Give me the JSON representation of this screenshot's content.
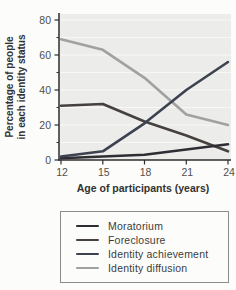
{
  "figure": {
    "y_axis_title_line1": "Percentage of people",
    "y_axis_title_line2": "in each identity status",
    "x_axis_title": "Age of participants (years)"
  },
  "chart_data": {
    "type": "line",
    "x": [
      12,
      15,
      18,
      21,
      24
    ],
    "xlabel": "Age of participants (years)",
    "ylabel": "Percentage of people in each identity status",
    "xlim": [
      12,
      24
    ],
    "ylim": [
      0,
      80
    ],
    "x_ticks": [
      12,
      15,
      18,
      21,
      24
    ],
    "y_ticks": [
      0,
      20,
      40,
      60,
      80
    ],
    "y_minor_ticks": [
      10,
      30,
      50,
      70
    ],
    "grid": "horizontal light gridlines on gray panel",
    "legend_position": "boxed below chart",
    "series": [
      {
        "name": "Moratorium",
        "color": "#2e2d33",
        "values": [
          1,
          2,
          3,
          6,
          9
        ]
      },
      {
        "name": "Foreclosure",
        "color": "#46403f",
        "values": [
          31,
          32,
          22,
          14,
          5
        ]
      },
      {
        "name": "Identity achievement",
        "color": "#3d4251",
        "values": [
          2,
          5,
          21,
          40,
          56
        ]
      },
      {
        "name": "Identity diffusion",
        "color": "#a1a19f",
        "values": [
          69,
          63,
          47,
          26,
          20
        ]
      }
    ],
    "legend": [
      "Moratorium",
      "Foreclosure",
      "Identity achievement",
      "Identity diffusion"
    ]
  },
  "colors": {
    "page_bg": "#fcfcfa",
    "plot_bg": "#ececea",
    "grid": "#f8f8f6",
    "axis": "#2e2e2e",
    "tick_label": "#4f4f4f",
    "axis_title": "#323232",
    "legend_border": "#8c8c8c",
    "legend_text": "#3c3c3c"
  }
}
